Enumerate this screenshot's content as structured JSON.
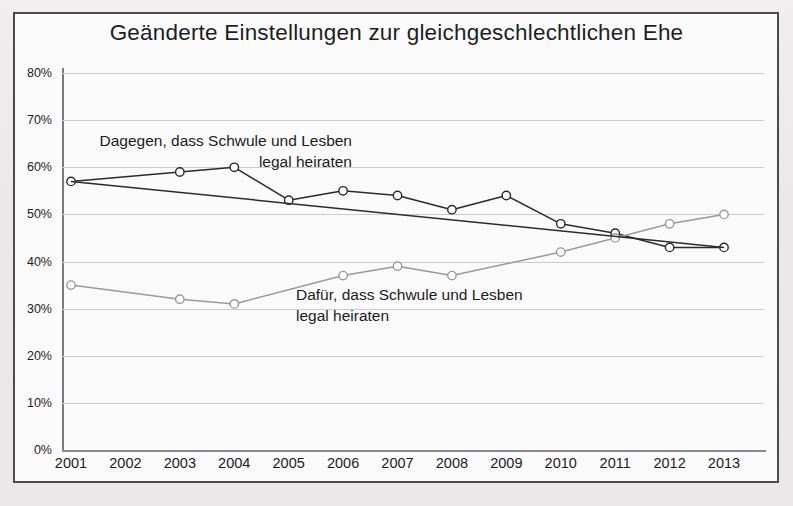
{
  "chart_data": {
    "type": "line",
    "title": "Geänderte Einstellungen zur gleichgeschlechtlichen Ehe",
    "xlabel": "",
    "ylabel": "",
    "ylim": [
      0,
      80
    ],
    "ytick_labels": [
      "0%",
      "10%",
      "20%",
      "30%",
      "40%",
      "50%",
      "60%",
      "70%",
      "80%"
    ],
    "ytick_values": [
      0,
      10,
      20,
      30,
      40,
      50,
      60,
      70,
      80
    ],
    "grid": true,
    "legend": "annotations",
    "categories": [
      "2001",
      "2002",
      "2003",
      "2004",
      "2005",
      "2006",
      "2007",
      "2008",
      "2009",
      "2010",
      "2011",
      "2012",
      "2013"
    ],
    "series": [
      {
        "name": "Dagegen, dass Schwule und Lesben legal heiraten",
        "color": "#2b2b2b",
        "values": [
          57,
          null,
          59,
          60,
          53,
          55,
          54,
          51,
          54,
          48,
          46,
          43,
          43
        ]
      },
      {
        "name": "Dafür, dass Schwule und Lesben legal heiraten",
        "color": "#9a9a9a",
        "values": [
          35,
          null,
          32,
          31,
          null,
          37,
          39,
          37,
          null,
          42,
          45,
          48,
          50
        ]
      },
      {
        "name": "Trendlinie Dagegen",
        "color": "#2b2b2b",
        "trend": true,
        "values": [
          57,
          null,
          null,
          null,
          null,
          null,
          null,
          null,
          null,
          null,
          null,
          null,
          43
        ]
      }
    ],
    "annotations": [
      {
        "id": "against",
        "text": "Dagegen, dass Schwule und Lesben\nlegal heiraten"
      },
      {
        "id": "for",
        "text": "Dafür, dass Schwule und Lesben\nlegal heiraten"
      }
    ],
    "colors": {
      "frame": "#4b4b4b",
      "plot_background": "#fbfafa",
      "page_background": "#eceaea",
      "gridline": "#c9c9cf",
      "axis": "#8a8a8f",
      "series_against": "#2b2b2b",
      "series_for": "#9a9a9a",
      "text": "#1d1d1d"
    }
  }
}
